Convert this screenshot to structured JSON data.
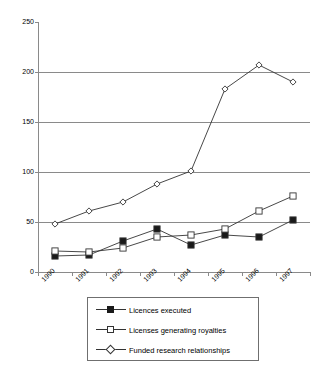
{
  "chart_data": {
    "type": "line",
    "title": "",
    "xlabel": "",
    "ylabel": "",
    "categories": [
      "1990",
      "1991",
      "1992",
      "1993",
      "1994",
      "1995",
      "1996",
      "1997"
    ],
    "ylim": [
      0,
      250
    ],
    "yticks": [
      0,
      50,
      100,
      150,
      200,
      250
    ],
    "grid": true,
    "legend_position": "bottom",
    "series": [
      {
        "name": "Licences executed",
        "marker": "filled-square",
        "values": [
          16,
          17,
          31,
          43,
          27,
          37,
          35,
          52
        ]
      },
      {
        "name": "Licenses generating royalties",
        "marker": "open-square",
        "values": [
          21,
          20,
          24,
          35,
          37,
          43,
          61,
          76
        ]
      },
      {
        "name": "Funded research relationships",
        "marker": "open-diamond",
        "values": [
          48,
          61,
          70,
          88,
          101,
          183,
          207,
          190
        ]
      }
    ]
  },
  "axis": {
    "y_tick_labels": [
      "250",
      "200",
      "150",
      "100",
      "50",
      "0"
    ],
    "x_tick_labels": [
      "1990",
      "1991",
      "1992",
      "1993",
      "1994",
      "1995",
      "1996",
      "1997"
    ]
  },
  "legend": {
    "items": [
      {
        "label": "Licences executed",
        "marker": "filled-square"
      },
      {
        "label": "Licenses generating royalties",
        "marker": "open-square"
      },
      {
        "label": "Funded research relationships",
        "marker": "open-diamond"
      }
    ]
  },
  "colors": {
    "line": "#333333",
    "grid": "#8a8a8a",
    "axis": "#8a8a8a",
    "marker_fill": "#1a1a1a",
    "marker_open": "#ffffff",
    "text": "#000000"
  }
}
